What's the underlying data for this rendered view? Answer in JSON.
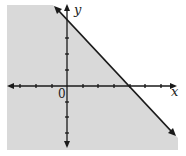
{
  "graph": {
    "type": "linear-inequality",
    "inequality": "x + y <= 4",
    "boundary_line": "x + y = 4",
    "boundary_style": "solid",
    "shaded_side": "below-left",
    "axis_labels": {
      "x": "x",
      "y": "y"
    },
    "origin_label": "0",
    "x_intercept": 4,
    "y_intercept": 4,
    "tick_spacing_units": 1,
    "x_ticks": [
      -3,
      -2,
      -1,
      1,
      2,
      3,
      4,
      5,
      6
    ],
    "y_ticks": [
      -4,
      -3,
      -2,
      -1,
      1,
      2,
      3,
      4
    ],
    "colors": {
      "shade": "#d9d9d9",
      "line": "#1a1a1a",
      "background": "#ffffff"
    }
  }
}
